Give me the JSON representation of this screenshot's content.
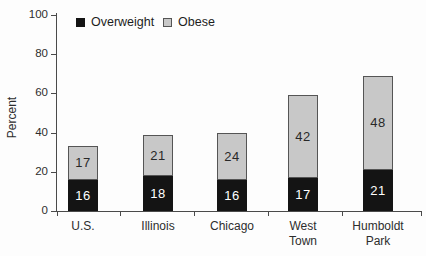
{
  "chart_data": {
    "type": "bar",
    "stacked": true,
    "ylabel": "Percent",
    "ylim": [
      0,
      100
    ],
    "yticks": [
      0,
      20,
      40,
      60,
      80,
      100
    ],
    "grid": false,
    "legend_position": "top",
    "categories": [
      "U.S.",
      "Illinois",
      "Chicago",
      "West\nTown",
      "Humboldt\nPark"
    ],
    "series": [
      {
        "name": "Overweight",
        "color": "#141414",
        "label_color": "#ffffff",
        "values": [
          16,
          18,
          16,
          17,
          21
        ]
      },
      {
        "name": "Obese",
        "color": "#c8c8c8",
        "border_color": "#555555",
        "label_color": "#282828",
        "values": [
          17,
          21,
          24,
          42,
          48
        ]
      }
    ]
  },
  "colors": {
    "axis": "#4a4a4a",
    "text": "#2d2d2d",
    "background": "#fdfdfd"
  }
}
